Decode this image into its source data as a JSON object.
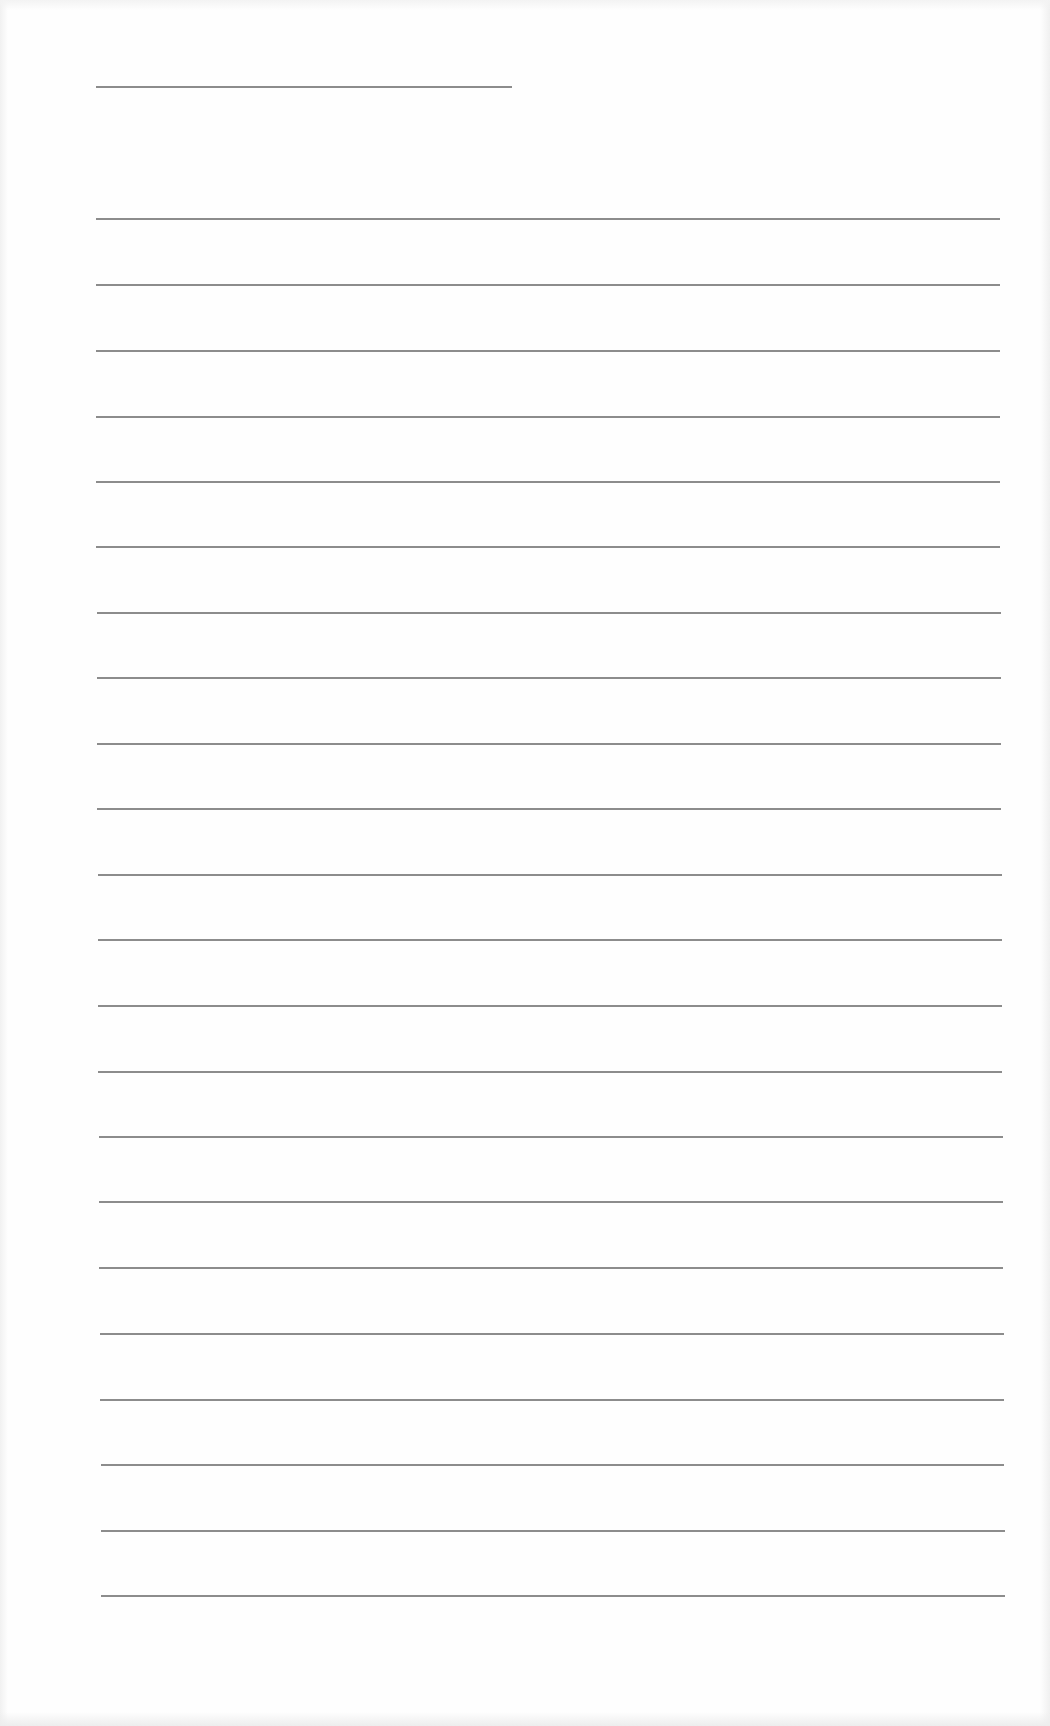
{
  "document": {
    "type": "lined-paper",
    "background_color": "#fefefe",
    "line_color": "#8c8c8c",
    "title_line": {
      "x1": 96,
      "x2": 512,
      "y": 86
    },
    "ruled_lines": [
      {
        "index": 1,
        "x1": 96,
        "x2": 1000,
        "y": 218
      },
      {
        "index": 2,
        "x1": 96,
        "x2": 1000,
        "y": 284
      },
      {
        "index": 3,
        "x1": 96,
        "x2": 1000,
        "y": 350
      },
      {
        "index": 4,
        "x1": 96,
        "x2": 1000,
        "y": 416
      },
      {
        "index": 5,
        "x1": 96,
        "x2": 1000,
        "y": 481
      },
      {
        "index": 6,
        "x1": 96,
        "x2": 1000,
        "y": 546
      },
      {
        "index": 7,
        "x1": 97,
        "x2": 1001,
        "y": 612
      },
      {
        "index": 8,
        "x1": 97,
        "x2": 1001,
        "y": 677
      },
      {
        "index": 9,
        "x1": 97,
        "x2": 1001,
        "y": 743
      },
      {
        "index": 10,
        "x1": 97,
        "x2": 1001,
        "y": 808
      },
      {
        "index": 11,
        "x1": 98,
        "x2": 1002,
        "y": 874
      },
      {
        "index": 12,
        "x1": 98,
        "x2": 1002,
        "y": 939
      },
      {
        "index": 13,
        "x1": 98,
        "x2": 1002,
        "y": 1005
      },
      {
        "index": 14,
        "x1": 98,
        "x2": 1002,
        "y": 1071
      },
      {
        "index": 15,
        "x1": 99,
        "x2": 1003,
        "y": 1136
      },
      {
        "index": 16,
        "x1": 99,
        "x2": 1003,
        "y": 1201
      },
      {
        "index": 17,
        "x1": 99,
        "x2": 1003,
        "y": 1267
      },
      {
        "index": 18,
        "x1": 100,
        "x2": 1004,
        "y": 1333
      },
      {
        "index": 19,
        "x1": 100,
        "x2": 1004,
        "y": 1399
      },
      {
        "index": 20,
        "x1": 101,
        "x2": 1004,
        "y": 1464
      },
      {
        "index": 21,
        "x1": 101,
        "x2": 1005,
        "y": 1530
      },
      {
        "index": 22,
        "x1": 101,
        "x2": 1005,
        "y": 1595
      }
    ],
    "description": "Blank ruled writing sheet with a short title line and 22 ruled lines"
  }
}
